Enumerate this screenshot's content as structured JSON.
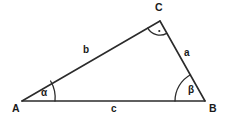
{
  "figure": {
    "type": "geometry-diagram",
    "background_color": "#ffffff",
    "stroke_color": "#2b2b2b",
    "text_color": "#1a1a1a"
  },
  "vertices": [
    {
      "id": "A",
      "label": "A",
      "x": 22,
      "y": 101
    },
    {
      "id": "B",
      "label": "B",
      "x": 205,
      "y": 101
    },
    {
      "id": "C",
      "label": "C",
      "x": 160,
      "y": 21
    }
  ],
  "sides": [
    {
      "id": "a",
      "label": "a",
      "from": "B",
      "to": "C",
      "label_x": 184,
      "label_y": 48
    },
    {
      "id": "b",
      "label": "b",
      "from": "A",
      "to": "C",
      "label_x": 83,
      "label_y": 45
    },
    {
      "id": "c",
      "label": "c",
      "from": "A",
      "to": "B",
      "label_x": 111,
      "label_y": 104
    }
  ],
  "angles": [
    {
      "id": "alpha",
      "label": "α",
      "at_vertex": "A",
      "arc_radius": 33,
      "marker": "arc"
    },
    {
      "id": "beta",
      "label": "β",
      "at_vertex": "B",
      "arc_radius": 30,
      "marker": "arc"
    },
    {
      "id": "gamma",
      "label": "",
      "at_vertex": "C",
      "arc_radius": 14,
      "marker": "arc-with-dot"
    }
  ]
}
